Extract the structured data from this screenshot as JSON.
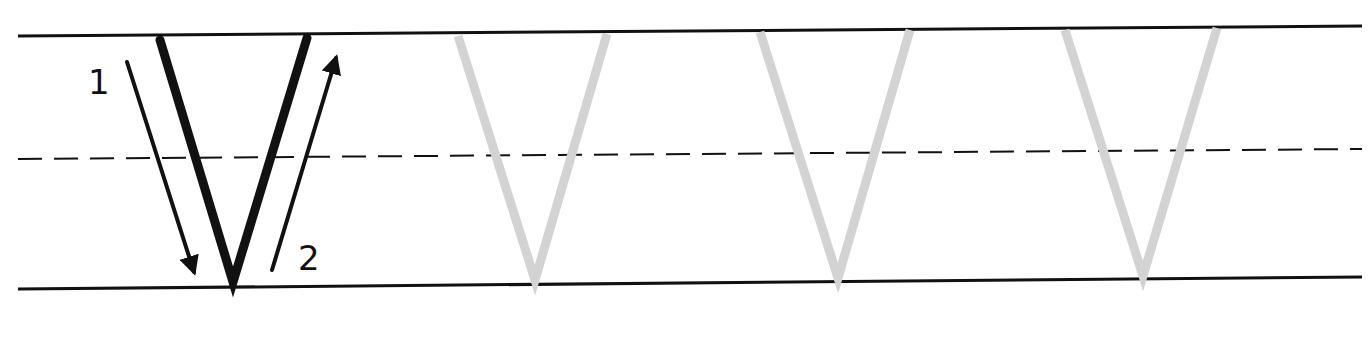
{
  "worksheet": {
    "letter": "V",
    "stroke_labels": [
      "1",
      "2"
    ],
    "tracing_copies": 3,
    "colors": {
      "guide_line": "#111111",
      "model_letter": "#111111",
      "trace_letter": "#d3d3d3",
      "background": "#ffffff"
    },
    "guides": {
      "top_line": {
        "x1": 18,
        "y1": 36,
        "x2": 1362,
        "y2": 26
      },
      "mid_dashed_line": {
        "x1": 18,
        "y1": 159,
        "x2": 1362,
        "y2": 149
      },
      "base_line": {
        "x1": 18,
        "y1": 289,
        "x2": 1362,
        "y2": 277
      }
    },
    "model_letter": {
      "points": [
        [
          160,
          40
        ],
        [
          233,
          282
        ],
        [
          307,
          38
        ]
      ]
    },
    "arrows": [
      {
        "label": "1",
        "from": [
          127,
          62
        ],
        "to": [
          194,
          272
        ],
        "label_pos": [
          88,
          94
        ]
      },
      {
        "label": "2",
        "from": [
          272,
          270
        ],
        "to": [
          336,
          58
        ],
        "label_pos": [
          298,
          270
        ]
      }
    ],
    "trace_letters": [
      {
        "points": [
          [
            458,
            36
          ],
          [
            535,
            280
          ],
          [
            607,
            34
          ]
        ]
      },
      {
        "points": [
          [
            760,
            32
          ],
          [
            838,
            278
          ],
          [
            910,
            30
          ]
        ]
      },
      {
        "points": [
          [
            1065,
            30
          ],
          [
            1143,
            276
          ],
          [
            1217,
            28
          ]
        ]
      }
    ]
  }
}
